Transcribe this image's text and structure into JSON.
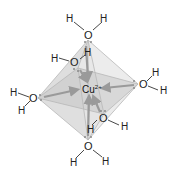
{
  "center": {
    "symbol": "Cu",
    "charge": "2+"
  },
  "ligands": [
    {
      "id": "top",
      "o": "O",
      "h1": "H",
      "h2": "H"
    },
    {
      "id": "back",
      "o": "O",
      "h1": "H",
      "h2": "H"
    },
    {
      "id": "left",
      "o": "O",
      "h1": "H",
      "h2": "H"
    },
    {
      "id": "right",
      "o": "O",
      "h1": "H",
      "h2": "H"
    },
    {
      "id": "front",
      "o": "O",
      "h1": "H",
      "h2": "H"
    },
    {
      "id": "bottom",
      "o": "O",
      "h1": "H",
      "h2": "H"
    }
  ],
  "geometry": "octahedral",
  "colors": {
    "face": "#c8c8c8",
    "edge": "#b8b8b8",
    "arrow": "#9a9a9a",
    "text": "#222222"
  }
}
